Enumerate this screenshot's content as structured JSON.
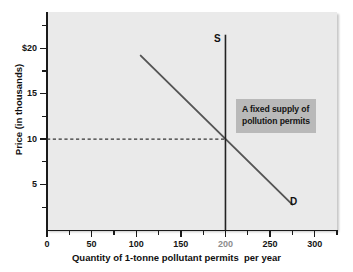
{
  "chart_data": {
    "type": "line",
    "title": "",
    "xlabel": "Quantity of 1-tonne pollutant permits  per year",
    "ylabel": "Price (in thousands)",
    "xlim": [
      0,
      325
    ],
    "ylim": [
      0,
      24
    ],
    "grid": false,
    "legend_position": "inline-labels",
    "x_ticks_major": [
      0,
      50,
      100,
      150,
      200,
      250,
      300
    ],
    "x_tick_labels": [
      "0",
      "50",
      "100",
      "150",
      "200",
      "250",
      "300"
    ],
    "x_ticks_minor": [
      25,
      75,
      125,
      175,
      225,
      275,
      325
    ],
    "y_ticks_major": [
      5,
      10,
      15,
      20
    ],
    "y_tick_labels": [
      "5",
      "10",
      "15",
      "$20"
    ],
    "y_ticks_minor": [
      2.5,
      7.5,
      12.5,
      17.5,
      22.5
    ],
    "series": [
      {
        "name": "D",
        "label": "D",
        "type": "line",
        "points": [
          [
            105,
            19.2
          ],
          [
            275,
            2.8
          ]
        ],
        "color": "#555555"
      },
      {
        "name": "S",
        "label": "S",
        "type": "vertical-line",
        "x": 200,
        "y_from": 0,
        "y_to": 21.5,
        "color": "#222222"
      }
    ],
    "equilibrium": {
      "quantity": 200,
      "price": 10,
      "guide_line": {
        "style": "dashed",
        "from": [
          0,
          10
        ],
        "to": [
          200,
          10
        ]
      }
    },
    "annotations": [
      {
        "name": "fixed-supply-callout",
        "lines": [
          "A fixed supply of",
          "pollution permits"
        ],
        "background": "#b9b9b9",
        "text_color": "#141414"
      }
    ]
  },
  "axes": {
    "y_title": "Price (in thousands)",
    "x_title": "Quantity of 1-tonne pollutant permits  per year",
    "y_labels": [
      {
        "value": 20,
        "text": "$20"
      },
      {
        "value": 15,
        "text": "15"
      },
      {
        "value": 10,
        "text": "10"
      },
      {
        "value": 5,
        "text": "5"
      }
    ],
    "x_labels": [
      {
        "value": 0,
        "text": "0",
        "dim": false
      },
      {
        "value": 50,
        "text": "50",
        "dim": false
      },
      {
        "value": 100,
        "text": "100",
        "dim": false
      },
      {
        "value": 150,
        "text": "150",
        "dim": false
      },
      {
        "value": 200,
        "text": "200",
        "dim": true
      },
      {
        "value": 250,
        "text": "250",
        "dim": false
      },
      {
        "value": 300,
        "text": "300",
        "dim": false
      }
    ]
  },
  "labels": {
    "supply": "S",
    "demand": "D"
  },
  "callout": {
    "line1": "A fixed supply of",
    "line2": "pollution permits"
  },
  "colors": {
    "panel_background": "#eaeaea",
    "page_background": "#ffffff",
    "axis": "#1a1a1a",
    "demand_line": "#555555",
    "supply_line": "#222222",
    "callout_background": "#b9b9b9",
    "dim_tick": "#8d8d8d"
  }
}
